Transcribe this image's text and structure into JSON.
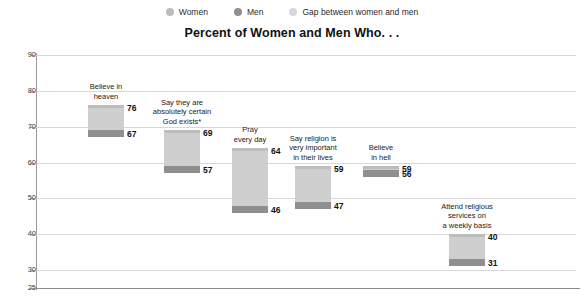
{
  "legend": {
    "items": [
      {
        "label": "Women",
        "color": "#bdbdbd",
        "icon": "legend-dot-icon"
      },
      {
        "label": "Men",
        "color": "#8f8f8f",
        "icon": "legend-dot-icon"
      },
      {
        "label": "Gap between women and men",
        "color": "#d9d9d9",
        "icon": "legend-dot-icon"
      }
    ]
  },
  "chart_data": {
    "type": "bar",
    "title": "Percent of Women and Men Who. . .",
    "subtitle": "",
    "xlabel": "",
    "ylabel": "",
    "ylim": [
      25,
      90
    ],
    "yticks": [
      25,
      30,
      40,
      50,
      60,
      70,
      80,
      90
    ],
    "ytick_labels": [
      "25",
      "30",
      "40",
      "50",
      "60",
      "70",
      "80",
      "90"
    ],
    "grid": true,
    "legend_position": "top-center",
    "categories": [
      "Believe in heaven",
      "Say they are absolutely certain God exists*",
      "Pray every day",
      "Say religion is very important in their lives",
      "Believe in hell",
      "Attend religious services on a weekly basis"
    ],
    "series": [
      {
        "name": "Women",
        "values": [
          76,
          69,
          64,
          59,
          59,
          40
        ]
      },
      {
        "name": "Men",
        "values": [
          67,
          57,
          46,
          47,
          56,
          31
        ]
      },
      {
        "name": "Gap between women and men",
        "values": [
          9,
          12,
          18,
          12,
          3,
          9
        ]
      }
    ],
    "colors": {
      "women": "#bdbdbd",
      "men": "#8f8f8f",
      "gap": "#cfcfcf",
      "gridline": "#d8d8d8",
      "axis": "#8c8c8c"
    },
    "bars": [
      {
        "category": "Believe in heaven",
        "label_lines": [
          "Believe in",
          "heaven"
        ],
        "women": 76,
        "men": 67,
        "gap": 9,
        "women_label": "76",
        "men_label": "67"
      },
      {
        "category": "Say they are absolutely certain God exists*",
        "label_lines": [
          "Say they are",
          "absolutely certain",
          "God exists*"
        ],
        "women": 69,
        "men": 57,
        "gap": 12,
        "women_label": "69",
        "men_label": "57"
      },
      {
        "category": "Pray every day",
        "label_lines": [
          "Pray",
          "every day"
        ],
        "women": 64,
        "men": 46,
        "gap": 18,
        "women_label": "64",
        "men_label": "46"
      },
      {
        "category": "Say religion is very important in their lives",
        "label_lines": [
          "Say religion is",
          "very important",
          "in their lives"
        ],
        "women": 59,
        "men": 47,
        "gap": 12,
        "women_label": "59",
        "men_label": "47"
      },
      {
        "category": "Believe in hell",
        "label_lines": [
          "Believe",
          "in hell"
        ],
        "women": 59,
        "men": 56,
        "gap": 3,
        "women_label": "59",
        "men_label": "56"
      },
      {
        "category": "Attend religious services on a weekly basis",
        "label_lines": [
          "Attend religious",
          "services on",
          "a weekly basis"
        ],
        "women": 40,
        "men": 31,
        "gap": 9,
        "women_label": "40",
        "men_label": "31"
      }
    ]
  }
}
